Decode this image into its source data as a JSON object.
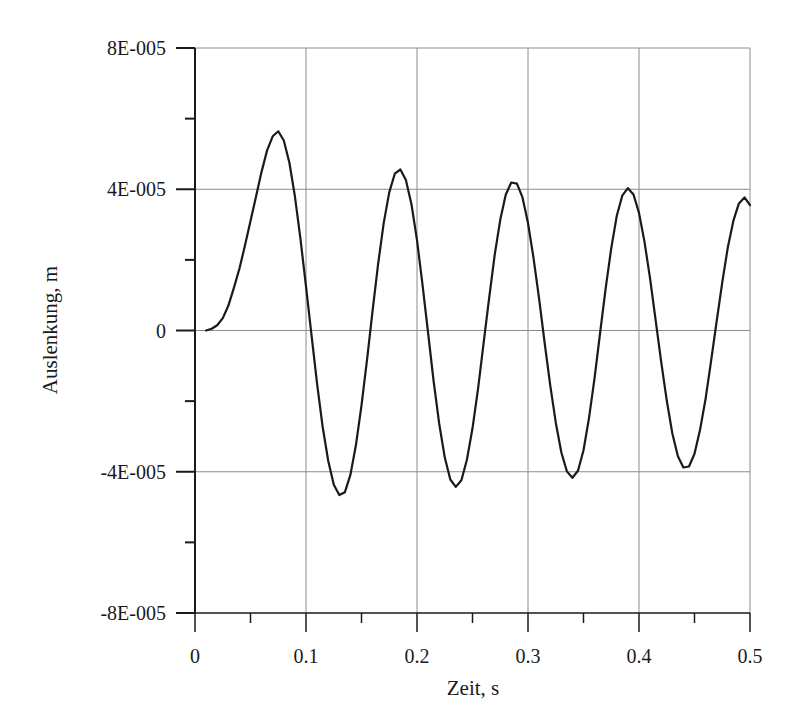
{
  "chart_data": {
    "type": "line",
    "title": "",
    "xlabel": "Zeit, s",
    "ylabel": "Auslenkung, m",
    "xlim": [
      0,
      0.5
    ],
    "ylim": [
      -8e-05,
      8e-05
    ],
    "grid": true,
    "legend": null,
    "x_ticks": [
      0,
      0.1,
      0.2,
      0.3,
      0.4,
      0.5
    ],
    "x_tick_labels": [
      "0",
      "0.1",
      "0.2",
      "0.3",
      "0.4",
      "0.5"
    ],
    "x_minor_ticks": [
      0.05,
      0.15,
      0.25,
      0.35,
      0.45
    ],
    "y_ticks": [
      -8e-05,
      -4e-05,
      0,
      4e-05,
      8e-05
    ],
    "y_tick_labels": [
      "-8E-005",
      "-4E-005",
      "0",
      "4E-005",
      "8E-005"
    ],
    "y_minor_ticks": [
      -6e-05,
      -2e-05,
      2e-05,
      6e-05
    ],
    "series": [
      {
        "name": "Auslenkung",
        "color": "#1a1a1a",
        "x": [
          0.01,
          0.015,
          0.02,
          0.025,
          0.03,
          0.035,
          0.04,
          0.045,
          0.05,
          0.055,
          0.06,
          0.065,
          0.07,
          0.075,
          0.08,
          0.085,
          0.09,
          0.095,
          0.1,
          0.105,
          0.11,
          0.115,
          0.12,
          0.125,
          0.13,
          0.135,
          0.14,
          0.145,
          0.15,
          0.155,
          0.16,
          0.165,
          0.17,
          0.175,
          0.18,
          0.185,
          0.19,
          0.195,
          0.2,
          0.205,
          0.21,
          0.215,
          0.22,
          0.225,
          0.23,
          0.235,
          0.24,
          0.245,
          0.25,
          0.255,
          0.26,
          0.265,
          0.27,
          0.275,
          0.28,
          0.285,
          0.29,
          0.295,
          0.3,
          0.305,
          0.31,
          0.315,
          0.32,
          0.325,
          0.33,
          0.335,
          0.34,
          0.345,
          0.35,
          0.355,
          0.36,
          0.365,
          0.37,
          0.375,
          0.38,
          0.385,
          0.39,
          0.395,
          0.4,
          0.405,
          0.41,
          0.415,
          0.42,
          0.425,
          0.43,
          0.435,
          0.44,
          0.445,
          0.45,
          0.455,
          0.46,
          0.465,
          0.47,
          0.475,
          0.48,
          0.485,
          0.49,
          0.495,
          0.5
        ],
        "y_e5": [
          0.0,
          0.05,
          0.15,
          0.35,
          0.7,
          1.2,
          1.75,
          2.4,
          3.1,
          3.8,
          4.5,
          5.1,
          5.5,
          5.64,
          5.38,
          4.75,
          3.8,
          2.61,
          1.25,
          -0.15,
          -1.51,
          -2.72,
          -3.69,
          -4.37,
          -4.66,
          -4.58,
          -4.09,
          -3.25,
          -2.12,
          -0.81,
          0.56,
          1.88,
          3.04,
          3.92,
          4.44,
          4.56,
          4.26,
          3.57,
          2.56,
          1.3,
          -0.07,
          -1.43,
          -2.64,
          -3.6,
          -4.22,
          -4.43,
          -4.24,
          -3.66,
          -2.77,
          -1.64,
          -0.36,
          0.93,
          2.14,
          3.14,
          3.85,
          4.19,
          4.16,
          3.77,
          3.04,
          2.06,
          0.9,
          -0.34,
          -1.55,
          -2.61,
          -3.45,
          -3.99,
          -4.17,
          -3.97,
          -3.39,
          -2.48,
          -1.34,
          -0.07,
          1.2,
          2.34,
          3.25,
          3.83,
          4.03,
          3.85,
          3.33,
          2.51,
          1.47,
          0.3,
          -0.89,
          -1.99,
          -2.91,
          -3.56,
          -3.88,
          -3.85,
          -3.49,
          -2.82,
          -1.93,
          -0.86,
          0.27,
          1.37,
          2.35,
          3.11,
          3.6,
          3.77,
          3.55
        ],
        "y_scale": 1e-05
      }
    ]
  },
  "colors": {
    "axis": "#1a1a1a",
    "grid": "#8c8c8c",
    "line": "#1a1a1a",
    "background": "#ffffff"
  }
}
